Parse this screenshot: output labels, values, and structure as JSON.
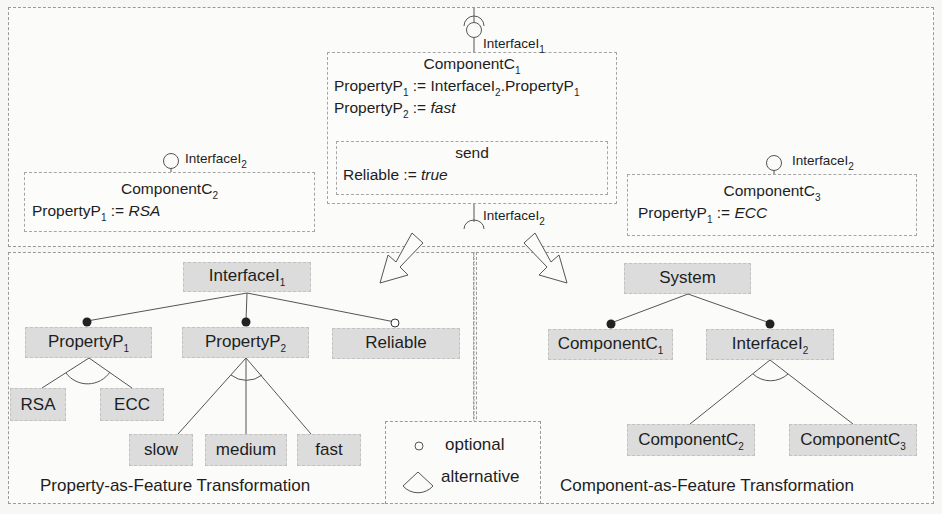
{
  "top_panel": {
    "component_c1": {
      "title": "ComponentC",
      "title_sub": "1",
      "interface_label": "InterfaceI",
      "interface_sub": "1",
      "rows": [
        {
          "lhs": "PropertyP",
          "lhs_sub": "1",
          "op": " := ",
          "rhs": "InterfaceI",
          "rhs_sub": "2",
          "rhs2": ".PropertyP",
          "rhs2_sub": "1"
        },
        {
          "lhs": "PropertyP",
          "lhs_sub": "2",
          "op": " := ",
          "rhs_italic": "fast"
        }
      ],
      "operation": {
        "name": "send",
        "lhs": "Reliable",
        "op": " := ",
        "rhs_italic": "true"
      },
      "required_interface_label": "InterfaceI",
      "required_interface_sub": "2"
    },
    "component_c2": {
      "title": "ComponentC",
      "title_sub": "2",
      "interface_label": "InterfaceI",
      "interface_sub": "2",
      "row": {
        "lhs": "PropertyP",
        "lhs_sub": "1",
        "op": " := ",
        "rhs_italic": "RSA"
      }
    },
    "component_c3": {
      "title": "ComponentC",
      "title_sub": "3",
      "interface_label": "InterfaceI",
      "interface_sub": "2",
      "row": {
        "lhs": "PropertyP",
        "lhs_sub": "1",
        "op": " := ",
        "rhs_italic": "ECC"
      }
    }
  },
  "property_tree": {
    "caption": "Property-as-Feature Transformation",
    "root": {
      "label": "InterfaceI",
      "sub": "1"
    },
    "children": [
      {
        "label": "PropertyP",
        "sub": "1",
        "kind": "mandatory"
      },
      {
        "label": "PropertyP",
        "sub": "2",
        "kind": "mandatory"
      },
      {
        "label": "Reliable",
        "sub": "",
        "kind": "optional"
      }
    ],
    "p1_alternatives": [
      "RSA",
      "ECC"
    ],
    "p2_alternatives": [
      "slow",
      "medium",
      "fast"
    ]
  },
  "component_tree": {
    "caption": "Component-as-Feature Transformation",
    "root": {
      "label": "System",
      "sub": ""
    },
    "children": [
      {
        "label": "ComponentC",
        "sub": "1",
        "kind": "mandatory"
      },
      {
        "label": "InterfaceI",
        "sub": "2",
        "kind": "mandatory"
      }
    ],
    "i2_alternatives": [
      {
        "label": "ComponentC",
        "sub": "2"
      },
      {
        "label": "ComponentC",
        "sub": "3"
      }
    ]
  },
  "legend": {
    "optional_label": "optional",
    "alternative_label": "alternative"
  },
  "colors": {
    "feature_fill": "#dcdcdc",
    "line": "#555555",
    "border": "#9a9a9a"
  }
}
